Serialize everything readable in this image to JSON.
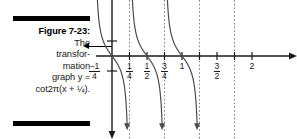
{
  "figure": {
    "label": "Figure 7-23:",
    "caption_lines": [
      "The",
      "transfor-",
      "mation",
      "graph y =",
      "cot2π(x + ¼)."
    ],
    "caption_full": "Figure 7-23: The transformation graph y = cot2π(x + ¼).",
    "pointer_icon": "left-arrow-icon",
    "rule_color": "#000000"
  },
  "chart_data": {
    "type": "line",
    "function": "y = cot 2π(x + 1/4)",
    "xlabel": "",
    "ylabel": "",
    "xlim": [
      -0.45,
      2.25
    ],
    "ylim": [
      -3.2,
      3.2
    ],
    "grid": false,
    "legend": null,
    "period": 0.5,
    "axis_color": "#1a1a1a",
    "curve_color": "#4d4d4d",
    "asymptote_color": "#808080",
    "x_ticks": [
      {
        "value": -0.25,
        "label": "-1/4",
        "type": "fraction",
        "numerator": "−1",
        "denominator": "4"
      },
      {
        "value": 0.25,
        "label": "1/4",
        "type": "fraction",
        "numerator": "1",
        "denominator": "4"
      },
      {
        "value": 0.5,
        "label": "1/2",
        "type": "fraction",
        "numerator": "1",
        "denominator": "2"
      },
      {
        "value": 0.75,
        "label": "3/4",
        "type": "fraction",
        "numerator": "3",
        "denominator": "4"
      },
      {
        "value": 1.0,
        "label": "1",
        "type": "integer"
      },
      {
        "value": 1.25,
        "label": "",
        "type": "none"
      },
      {
        "value": 1.5,
        "label": "3/2",
        "type": "fraction",
        "numerator": "3",
        "denominator": "2"
      },
      {
        "value": 1.75,
        "label": "",
        "type": "none"
      },
      {
        "value": 2.0,
        "label": "2",
        "type": "integer"
      }
    ],
    "y_ticks": [
      {
        "value": 1,
        "label": ""
      },
      {
        "value": -1,
        "label": ""
      }
    ],
    "asymptotes": [
      -0.25,
      0.25,
      0.75,
      1.25,
      1.75
    ],
    "branches": [
      {
        "from": -0.25,
        "to": 0.25,
        "direction": "decreasing",
        "arrow": "down"
      },
      {
        "from": 0.25,
        "to": 0.75,
        "direction": "decreasing",
        "arrow": "down"
      },
      {
        "from": 0.75,
        "to": 1.25,
        "direction": "decreasing",
        "arrow": "down"
      }
    ],
    "x_axis_arrow": "right",
    "y_axis_arrow": "down"
  }
}
